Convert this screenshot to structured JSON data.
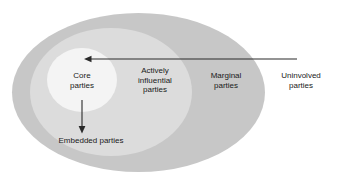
{
  "diagram": {
    "type": "concentric-ellipse-venn",
    "zones": [
      {
        "id": "core",
        "label": "Core\nparties",
        "fill": "#f4f4f4",
        "order": 1
      },
      {
        "id": "actively-influential",
        "label": "Actively\ninfluential\nparties",
        "fill": "#dcdcdc",
        "order": 2
      },
      {
        "id": "marginal",
        "label": "Marginal\nparties",
        "fill": "#c7c7c7",
        "order": 3
      },
      {
        "id": "uninvolved",
        "label": "Uninvolved\nparties",
        "fill": "#ffffff",
        "order": 4
      }
    ],
    "annotations": [
      {
        "id": "embedded",
        "label": "Embedded parties"
      }
    ],
    "arrows": [
      {
        "id": "uninvolved-to-core",
        "direction": "left",
        "from_x": 297,
        "from_y": 59,
        "to_x": 84,
        "to_y": 59
      },
      {
        "id": "core-to-embedded",
        "direction": "down",
        "from_x": 82,
        "from_y": 100,
        "to_x": 82,
        "to_y": 133
      }
    ],
    "stroke_color": "#2a2a2a"
  }
}
